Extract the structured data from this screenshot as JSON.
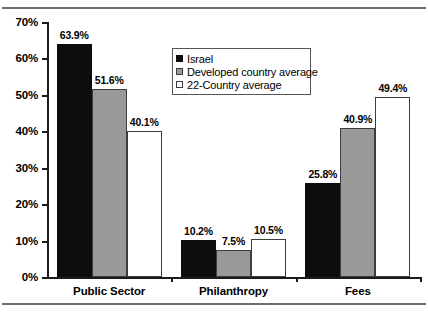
{
  "chart_data": {
    "type": "bar",
    "title": "",
    "subtitle": "",
    "xlabel": "",
    "ylabel": "",
    "categories": [
      "Public Sector",
      "Philanthropy",
      "Fees"
    ],
    "series": [
      {
        "name": "Israel",
        "color": "#0d0d0d",
        "values": [
          63.9,
          10.2,
          25.8
        ],
        "labels": [
          "63.9%",
          "10.2%",
          "25.8%"
        ]
      },
      {
        "name": "Developed country average",
        "color": "#999999",
        "values": [
          51.6,
          7.5,
          40.9
        ],
        "labels": [
          "51.6%",
          "7.5%",
          "40.9%"
        ]
      },
      {
        "name": "22-Country average",
        "color": "#ffffff",
        "values": [
          40.1,
          10.5,
          49.4
        ],
        "labels": [
          "40.1%",
          "10.5%",
          "49.4%"
        ]
      }
    ],
    "ylim": [
      0,
      70
    ],
    "ytick_values": [
      0,
      10,
      20,
      30,
      40,
      50,
      60,
      70
    ],
    "ytick_labels": [
      "0%",
      "10%",
      "20%",
      "30%",
      "40%",
      "50%",
      "60%",
      "70%"
    ],
    "grid": false,
    "legend_position": "upper center",
    "value_labels_shown": true,
    "axis_color": "#1a1a1a",
    "background_color": "#ffffff"
  }
}
